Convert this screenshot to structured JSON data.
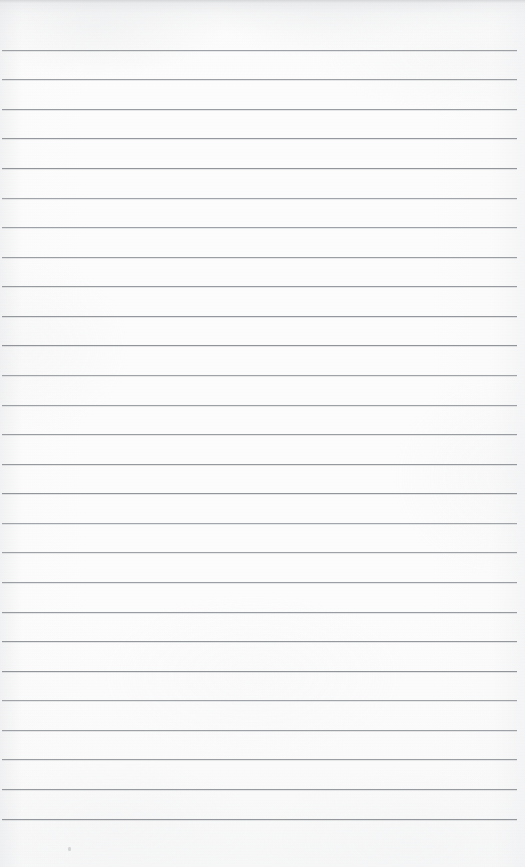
{
  "document": {
    "kind": "scanned-lined-paper",
    "title": "Blank lined notepad page",
    "content_text": "",
    "page_width_px": 525,
    "page_height_px": 867,
    "paper_color": "#fcfcfc",
    "rule_color": "#8d9196",
    "rule_count": 27,
    "rule_first_y_px": 50,
    "rule_spacing_px": 29.6,
    "rule_left_x_px": 2,
    "rule_right_x_px": 517,
    "rule_thickness_px": 1,
    "top_margin_px": 50,
    "bottom_margin_px": 47,
    "marks": [
      {
        "name": "scan-speck",
        "x_px": 68,
        "y_px": 847
      }
    ]
  },
  "rules": [
    {
      "index": 1,
      "y": 50
    },
    {
      "index": 2,
      "y": 79
    },
    {
      "index": 3,
      "y": 109
    },
    {
      "index": 4,
      "y": 138
    },
    {
      "index": 5,
      "y": 168
    },
    {
      "index": 6,
      "y": 198
    },
    {
      "index": 7,
      "y": 227
    },
    {
      "index": 8,
      "y": 257
    },
    {
      "index": 9,
      "y": 286
    },
    {
      "index": 10,
      "y": 316
    },
    {
      "index": 11,
      "y": 345
    },
    {
      "index": 12,
      "y": 375
    },
    {
      "index": 13,
      "y": 405
    },
    {
      "index": 14,
      "y": 434
    },
    {
      "index": 15,
      "y": 464
    },
    {
      "index": 16,
      "y": 493
    },
    {
      "index": 17,
      "y": 523
    },
    {
      "index": 18,
      "y": 552
    },
    {
      "index": 19,
      "y": 582
    },
    {
      "index": 20,
      "y": 612
    },
    {
      "index": 21,
      "y": 641
    },
    {
      "index": 22,
      "y": 671
    },
    {
      "index": 23,
      "y": 700
    },
    {
      "index": 24,
      "y": 730
    },
    {
      "index": 25,
      "y": 759
    },
    {
      "index": 26,
      "y": 789
    },
    {
      "index": 27,
      "y": 819
    }
  ]
}
